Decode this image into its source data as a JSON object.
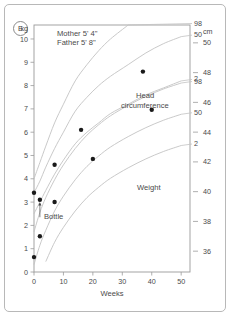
{
  "figure": {
    "panel_letter": "E",
    "parent_heights": [
      "Mother  5' 4\"",
      "Father   5' 8\""
    ]
  },
  "chart_data": {
    "type": "line",
    "title": "",
    "subtitle": "",
    "xlabel": "Weeks",
    "ylabel_left": "kg",
    "ylabel_right": "cm",
    "xlim": [
      0,
      53
    ],
    "xticks": [
      0,
      10,
      20,
      30,
      40,
      50
    ],
    "xtick_labels": [
      "0",
      "10",
      "20",
      "30",
      "40",
      "50"
    ],
    "left_axis": {
      "unit": "kg",
      "ylim": [
        0,
        10.6
      ],
      "yticks": [
        0,
        1,
        2,
        3,
        4,
        5,
        6,
        7,
        8,
        9,
        10
      ],
      "ytick_labels": [
        "0",
        "1",
        "2",
        "3",
        "4",
        "5",
        "6",
        "7",
        "8",
        "9",
        "10"
      ]
    },
    "right_axis": {
      "unit": "cm",
      "ylim": [
        34.6,
        51.2
      ],
      "yticks": [
        36,
        38,
        40,
        42,
        44,
        46,
        48,
        50
      ],
      "ytick_labels": [
        "36",
        "38",
        "40",
        "42",
        "44",
        "46",
        "48",
        "50"
      ]
    },
    "grid": false,
    "legend": "inline-labels",
    "series": [
      {
        "name": "Head circumference 98th centile",
        "label": "98",
        "axis": "right",
        "kind": "centile",
        "x": [
          0,
          2,
          4,
          7,
          10,
          14,
          18,
          22,
          26,
          32,
          38,
          44,
          50
        ],
        "y": [
          37.3,
          38.6,
          39.6,
          40.8,
          41.8,
          42.9,
          43.8,
          44.5,
          45.1,
          45.8,
          46.4,
          46.9,
          47.3
        ]
      },
      {
        "name": "Head circumference 50th centile",
        "label": "50",
        "axis": "right",
        "kind": "centile",
        "x": [
          0,
          2,
          4,
          7,
          10,
          14,
          18,
          22,
          26,
          32,
          38,
          44,
          50
        ],
        "y": [
          35.1,
          36.4,
          37.4,
          38.7,
          39.7,
          40.8,
          41.7,
          42.4,
          43.0,
          43.7,
          44.3,
          44.8,
          45.2
        ]
      },
      {
        "name": "Head circumference 2nd centile",
        "label": "2",
        "axis": "right",
        "kind": "centile",
        "x": [
          0,
          2,
          4,
          7,
          10,
          14,
          18,
          22,
          26,
          32,
          38,
          44,
          50
        ],
        "y": [
          33.0,
          34.3,
          35.3,
          36.6,
          37.6,
          38.7,
          39.6,
          40.3,
          40.9,
          41.6,
          42.2,
          42.7,
          43.1
        ]
      },
      {
        "name": "Weight 98th centile",
        "label": "98",
        "axis": "left",
        "kind": "centile",
        "x": [
          0,
          2,
          4,
          7,
          10,
          14,
          18,
          22,
          26,
          32,
          38,
          44,
          50
        ],
        "y": [
          4.0,
          4.7,
          5.4,
          6.4,
          7.2,
          8.2,
          8.9,
          9.5,
          10.0,
          10.6,
          11.2,
          11.7,
          12.1
        ]
      },
      {
        "name": "Weight 50th centile",
        "label": "50",
        "axis": "left",
        "kind": "centile",
        "x": [
          0,
          2,
          4,
          7,
          10,
          14,
          18,
          22,
          26,
          32,
          38,
          44,
          50
        ],
        "y": [
          3.4,
          3.9,
          4.5,
          5.3,
          6.0,
          6.9,
          7.5,
          8.0,
          8.4,
          8.9,
          9.4,
          9.8,
          10.1
        ]
      },
      {
        "name": "Weight 2nd centile",
        "label": "2",
        "axis": "left",
        "kind": "centile",
        "x": [
          0,
          2,
          4,
          7,
          10,
          14,
          18,
          22,
          26,
          32,
          38,
          44,
          50
        ],
        "y": [
          2.5,
          3.0,
          3.5,
          4.2,
          4.8,
          5.5,
          6.0,
          6.4,
          6.8,
          7.2,
          7.6,
          7.9,
          8.2
        ]
      },
      {
        "name": "Head circumference measurements",
        "label": "Head circumference",
        "axis": "right",
        "kind": "points",
        "points": [
          {
            "x": 0,
            "y": 35.6
          },
          {
            "x": 2,
            "y": 37.0
          },
          {
            "x": 7,
            "y": 39.3
          },
          {
            "x": 20,
            "y": 42.2
          },
          {
            "x": 40,
            "y": 45.5
          }
        ]
      },
      {
        "name": "Weight measurements",
        "label": "Weight",
        "axis": "left",
        "kind": "points",
        "points": [
          {
            "x": 0,
            "y": 3.4
          },
          {
            "x": 2,
            "y": 3.1
          },
          {
            "x": 7,
            "y": 4.6
          },
          {
            "x": 16,
            "y": 6.1
          },
          {
            "x": 37,
            "y": 8.6
          }
        ]
      }
    ],
    "annotations": [
      {
        "name": "bottle",
        "text": "Bottle",
        "x": 2,
        "y_left": 2.35,
        "arrow_to_y_left": 3.0
      }
    ],
    "series_labels": [
      {
        "name": "head-circumference",
        "line1": "Head",
        "line2": "circumference"
      },
      {
        "name": "weight",
        "line1": "Weight",
        "line2": ""
      }
    ]
  }
}
